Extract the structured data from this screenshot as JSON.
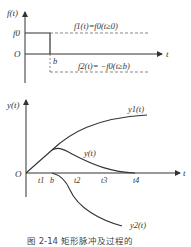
{
  "figure": {
    "caption": "图 2-14   矩形脉冲及过程的"
  },
  "top_chart": {
    "y_axis_label": "f(t)",
    "x_axis_label": "t",
    "origin_label": "O",
    "level_label": "f0",
    "b_label": "b",
    "f1_label": "f1(t)=f0(t≥0)",
    "f2_label": "f2(t)= −f0(t≥b)"
  },
  "bottom_chart": {
    "y_axis_label": "y(t)",
    "x_axis_label": "t",
    "origin_label": "O",
    "tick_labels": [
      "t1",
      "b",
      "t2",
      "t3",
      "t4"
    ],
    "curve_labels": {
      "y1": "y1(t)",
      "y": "y(t)",
      "y2": "y2(t)"
    }
  }
}
